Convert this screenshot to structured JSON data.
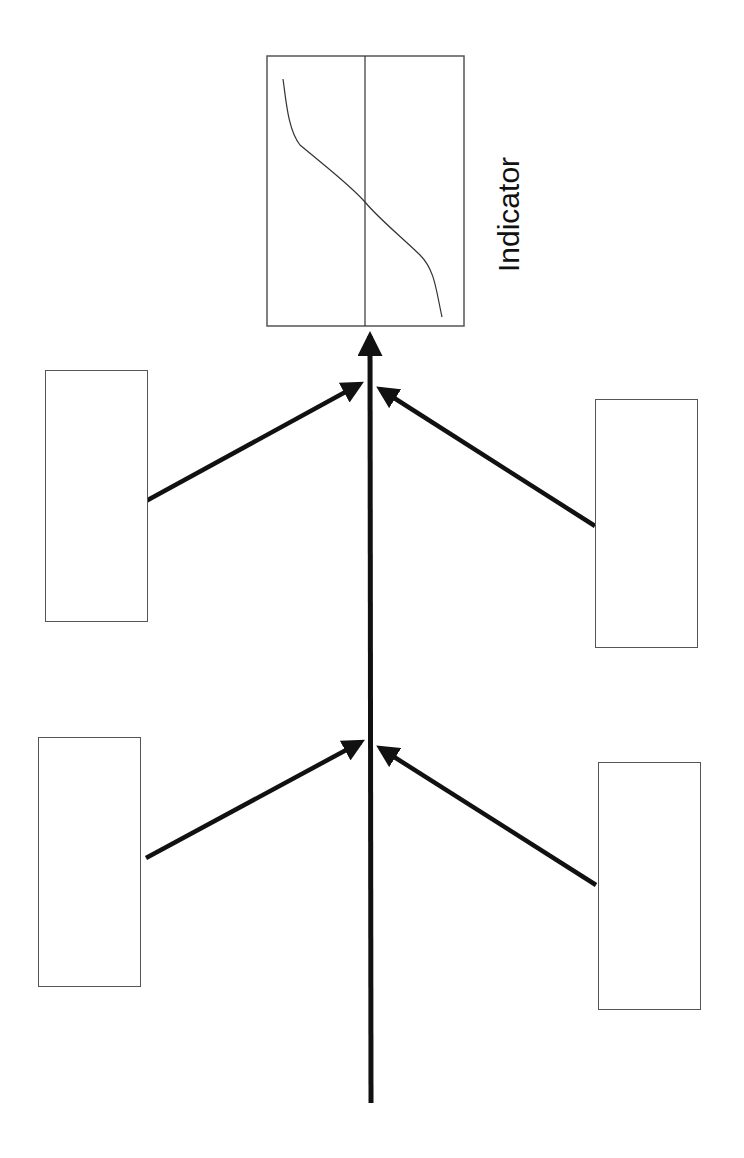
{
  "diagram": {
    "type": "fishbone",
    "indicator": {
      "label": "Indicator",
      "box": {
        "x": 267,
        "y": 56,
        "w": 198,
        "h": 271
      },
      "divider_x": 365,
      "curve": "sigmoid (decreasing from top-left to bottom-right, crossing divider at center)"
    },
    "spine": {
      "x": 370,
      "y_start": 1103,
      "y_end": 330,
      "color": "#111111"
    },
    "branches": [
      {
        "id": "top-left",
        "label": "",
        "box": {
          "x": 45,
          "y": 370,
          "w": 103,
          "h": 252
        },
        "from": [
          146,
          501
        ],
        "to": [
          364,
          382
        ]
      },
      {
        "id": "top-right",
        "label": "",
        "box": {
          "x": 595,
          "y": 399,
          "w": 103,
          "h": 249
        },
        "from": [
          595,
          526
        ],
        "to": [
          376,
          386
        ]
      },
      {
        "id": "bottom-left",
        "label": "",
        "box": {
          "x": 38,
          "y": 737,
          "w": 103,
          "h": 250
        },
        "from": [
          146,
          858
        ],
        "to": [
          365,
          740
        ]
      },
      {
        "id": "bottom-right",
        "label": "",
        "box": {
          "x": 598,
          "y": 762,
          "w": 103,
          "h": 248
        },
        "from": [
          596,
          885
        ],
        "to": [
          376,
          745
        ]
      }
    ],
    "colors": {
      "line": "#111111",
      "box_border": "#555555",
      "background": "#ffffff"
    }
  }
}
